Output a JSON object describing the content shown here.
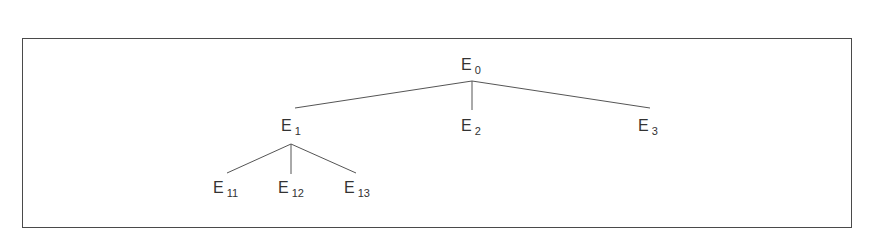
{
  "diagram": {
    "type": "tree",
    "border_color": "#4a4a4a",
    "line_color": "#555555",
    "nodes": {
      "e0": {
        "base": "E",
        "sub": "0"
      },
      "e1": {
        "base": "E",
        "sub": "1"
      },
      "e2": {
        "base": "E",
        "sub": "2"
      },
      "e3": {
        "base": "E",
        "sub": "3"
      },
      "e11": {
        "base": "E",
        "sub": "11"
      },
      "e12": {
        "base": "E",
        "sub": "12"
      },
      "e13": {
        "base": "E",
        "sub": "13"
      }
    },
    "edges": [
      {
        "from": "E0",
        "to": "E1"
      },
      {
        "from": "E0",
        "to": "E2"
      },
      {
        "from": "E0",
        "to": "E3"
      },
      {
        "from": "E1",
        "to": "E11"
      },
      {
        "from": "E1",
        "to": "E12"
      },
      {
        "from": "E1",
        "to": "E13"
      }
    ]
  }
}
